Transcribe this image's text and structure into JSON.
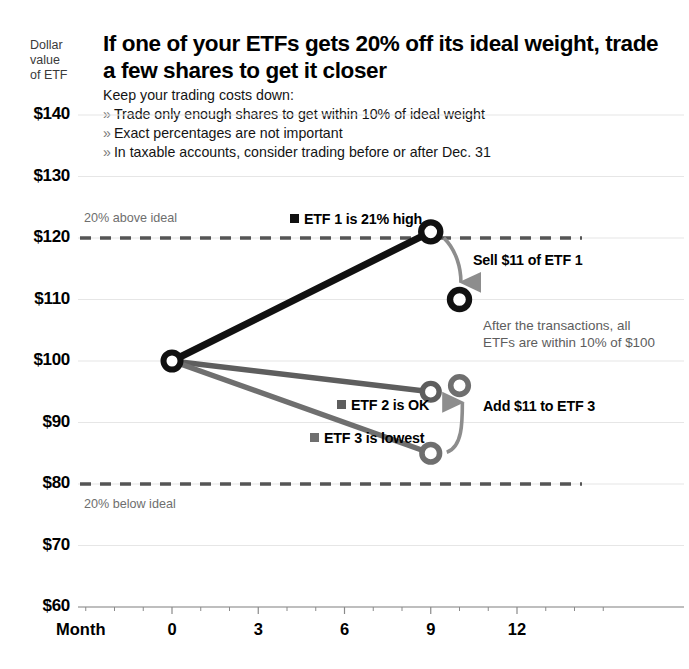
{
  "header": {
    "axis_caption_lines": [
      "Dollar",
      "value",
      "of ETF"
    ],
    "headline": "If one of your ETFs gets 20% off its ideal weight, trade a few shares to get it closer",
    "lede": "Keep your trading costs down:",
    "bullet_mark": "»",
    "bullets": [
      "Trade only enough shares to get within 10% of ideal weight",
      "Exact percentages are not important",
      "In taxable accounts, consider trading before or after Dec. 31"
    ]
  },
  "annotations": {
    "band_above": "20% above ideal",
    "band_below": "20% below ideal",
    "sell_callout": "Sell $11 of ETF 1",
    "add_callout": "Add $11 to ETF 3",
    "summary_note_line1": "After the transactions, all",
    "summary_note_line2": "ETFs are within 10% of $100"
  },
  "colors": {
    "etf1": "#111111",
    "etf2": "#5e5e5e",
    "etf3": "#6f6f6f",
    "band_line": "#555555",
    "grid": "#e6e6e6",
    "axis": "#8a8a8a",
    "note_text": "#5d5d5d",
    "band_text": "#6e6e6e"
  },
  "chart_data": {
    "type": "line",
    "title": "If one of your ETFs gets 20% off its ideal weight, trade a few shares to get it closer",
    "xlabel": "Month",
    "ylabel": "Dollar value of ETF",
    "xlim": [
      -2,
      14
    ],
    "ylim": [
      60,
      140
    ],
    "yticks": [
      140,
      130,
      120,
      110,
      100,
      90,
      80,
      70,
      60
    ],
    "ytick_labels": [
      "$140",
      "$130",
      "$120",
      "$110",
      "$100",
      "$90",
      "$80",
      "$70",
      "$60"
    ],
    "xticks": [
      0,
      3,
      6,
      9,
      12
    ],
    "xtick_labels": [
      "0",
      "3",
      "6",
      "9",
      "12"
    ],
    "x_minor_step": 1,
    "grid": true,
    "legend": "inline-labels",
    "reference_lines": [
      {
        "name": "20% above ideal",
        "value": 120,
        "style": "dashed"
      },
      {
        "name": "20% below ideal",
        "value": 80,
        "style": "dashed"
      }
    ],
    "series": [
      {
        "name": "ETF 1",
        "label": "ETF 1 is 21% high",
        "color": "#111111",
        "x": [
          0,
          9
        ],
        "values": [
          100,
          121
        ],
        "post_trade": {
          "x": 10,
          "value": 110
        }
      },
      {
        "name": "ETF 2",
        "label": "ETF 2 is OK",
        "color": "#5e5e5e",
        "x": [
          0,
          9
        ],
        "values": [
          100,
          95
        ],
        "post_trade": null
      },
      {
        "name": "ETF 3",
        "label": "ETF 3 is lowest",
        "color": "#6f6f6f",
        "x": [
          0,
          9
        ],
        "values": [
          100,
          85
        ],
        "post_trade": {
          "x": 10,
          "value": 96
        }
      }
    ],
    "transactions": [
      {
        "label": "Sell $11 of ETF 1",
        "amount": -11,
        "series": "ETF 1"
      },
      {
        "label": "Add $11 to ETF 3",
        "amount": 11,
        "series": "ETF 3"
      }
    ]
  }
}
